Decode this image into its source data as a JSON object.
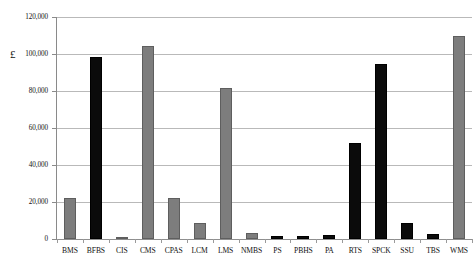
{
  "chart_data": {
    "type": "bar",
    "title": "",
    "subtitle": "",
    "xlabel": "",
    "ylabel": "£",
    "ylim": [
      0,
      120000
    ],
    "ytick_values": [
      0,
      20000,
      40000,
      60000,
      80000,
      100000,
      120000
    ],
    "ytick_labels": [
      "0",
      "20,000",
      "40,000",
      "60,000",
      "80,000",
      "100,000",
      "120,000"
    ],
    "grid": true,
    "legend": "none",
    "categories": [
      "BMS",
      "BFBS",
      "CIS",
      "CMS",
      "CPAS",
      "LCM",
      "LMS",
      "NMBS",
      "PS",
      "PBHS",
      "PA",
      "RTS",
      "SPCK",
      "SSU",
      "TBS",
      "WMS"
    ],
    "values": [
      22000,
      98500,
      800,
      104500,
      22000,
      8500,
      81500,
      3000,
      1800,
      1500,
      2200,
      52000,
      94500,
      8500,
      2500,
      110000
    ],
    "bar_colors": [
      "#7d7d7d",
      "#0b0b0b",
      "#7d7d7d",
      "#7d7d7d",
      "#7d7d7d",
      "#7d7d7d",
      "#7d7d7d",
      "#7d7d7d",
      "#0b0b0b",
      "#0b0b0b",
      "#0b0b0b",
      "#0b0b0b",
      "#0b0b0b",
      "#0b0b0b",
      "#0b0b0b",
      "#7d7d7d"
    ]
  },
  "colors": {
    "gray_bar": "#7d7d7d",
    "black_bar": "#0b0b0b",
    "gridline": "#b9b9b9",
    "axis": "#8a8a8a",
    "background": "#ffffff"
  }
}
